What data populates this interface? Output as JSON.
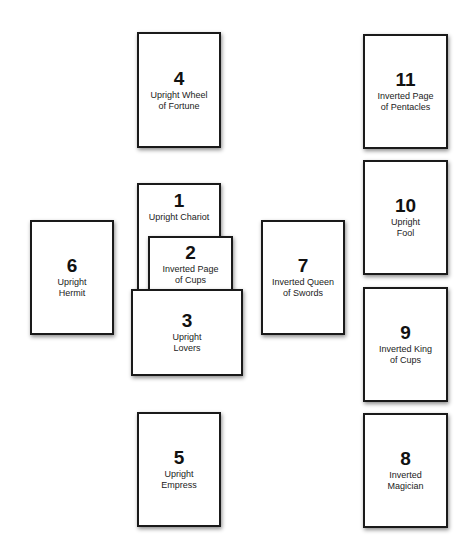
{
  "spread": {
    "cards": [
      {
        "position": "1",
        "label": "Upright Chariot",
        "orientation": "Upright",
        "card_name": "Chariot"
      },
      {
        "position": "2",
        "label": "Inverted Page\nof Cups",
        "orientation": "Inverted",
        "card_name": "Page of Cups"
      },
      {
        "position": "3",
        "label": "Upright\nLovers",
        "orientation": "Upright",
        "card_name": "Lovers"
      },
      {
        "position": "4",
        "label": "Upright Wheel\nof Fortune",
        "orientation": "Upright",
        "card_name": "Wheel of Fortune"
      },
      {
        "position": "5",
        "label": "Upright\nEmpress",
        "orientation": "Upright",
        "card_name": "Empress"
      },
      {
        "position": "6",
        "label": "Upright\nHermit",
        "orientation": "Upright",
        "card_name": "Hermit"
      },
      {
        "position": "7",
        "label": "Inverted Queen\nof Swords",
        "orientation": "Inverted",
        "card_name": "Queen of Swords"
      },
      {
        "position": "8",
        "label": "Inverted\nMagician",
        "orientation": "Inverted",
        "card_name": "Magician"
      },
      {
        "position": "9",
        "label": "Inverted King\nof Cups",
        "orientation": "Inverted",
        "card_name": "King of Cups"
      },
      {
        "position": "10",
        "label": "Upright\nFool",
        "orientation": "Upright",
        "card_name": "Fool"
      },
      {
        "position": "11",
        "label": "Inverted Page\nof Pentacles",
        "orientation": "Inverted",
        "card_name": "Page of Pentacles"
      }
    ]
  },
  "colors": {
    "background": "#ffffff",
    "card_fill": "#ffffff",
    "card_border": "#1a1a1a",
    "text": "#111111"
  }
}
